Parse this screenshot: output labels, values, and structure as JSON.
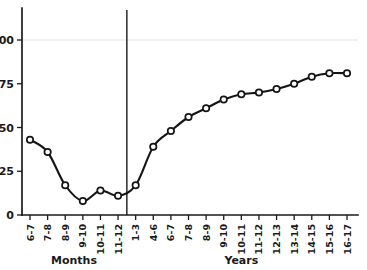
{
  "chart_data": {
    "type": "line",
    "title": "",
    "subtitle": "",
    "xlabel": "",
    "ylabel": "",
    "ylim": [
      0,
      112
    ],
    "yticks": [
      0,
      25,
      50,
      75,
      100
    ],
    "ytick_labels": [
      "0",
      "25",
      "50",
      "75",
      "100"
    ],
    "grid": "horizontal gridline at 100 only",
    "legend": "none",
    "marker_style": "open circle",
    "line_style": "smooth fitted curve through points",
    "categories": [
      "6-7",
      "7-8",
      "8-9",
      "9-10",
      "10-11",
      "11-12",
      "1-3",
      "4-6",
      "6-7",
      "7-8",
      "8-9",
      "9-10",
      "10-11",
      "11-12",
      "12-13",
      "13-14",
      "14-15",
      "15-16",
      "16-17"
    ],
    "values": [
      43,
      36,
      17,
      8,
      14,
      11,
      17,
      39,
      48,
      56,
      61,
      66,
      69,
      70,
      72,
      75,
      79,
      81,
      81
    ],
    "groups": [
      {
        "label": "Months",
        "start_index": 0,
        "end_index": 5
      },
      {
        "label": "Years",
        "start_index": 6,
        "end_index": 18
      }
    ],
    "divider_after_index": 5,
    "n_points": 19
  },
  "axis": {
    "y_tick_0": "0",
    "y_tick_25": "25",
    "y_tick_50": "50",
    "y_tick_75": "75",
    "y_tick_100": "100"
  },
  "groups": {
    "months_label": "Months",
    "years_label": "Years"
  },
  "colors": {
    "ink": "#151515",
    "grid": "#d9d9d9",
    "background": "#ffffff",
    "marker_fill": "#ffffff"
  }
}
